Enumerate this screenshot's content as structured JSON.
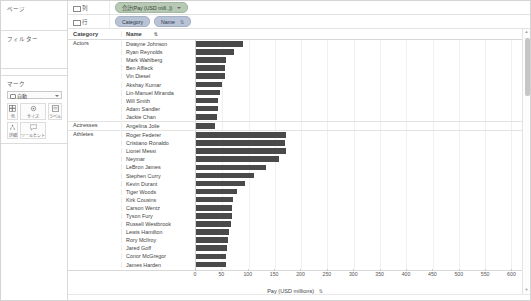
{
  "left_panel": {
    "pages_title": "ページ",
    "filters_title": "フィルター",
    "marks_title": "マーク",
    "marks_type": "自動",
    "marks_buttons": [
      {
        "label": "色",
        "icon": "color-icon"
      },
      {
        "label": "サイズ",
        "icon": "size-icon"
      },
      {
        "label": "ラベル",
        "icon": "label-icon"
      },
      {
        "label": "詳細",
        "icon": "detail-icon"
      },
      {
        "label": "ツールヒント",
        "icon": "tooltip-icon"
      }
    ]
  },
  "shelves": {
    "columns_label": "列",
    "rows_label": "行",
    "columns_pills": [
      {
        "text": "合計(Pay (USD mill..))",
        "color": "green",
        "caret": true
      }
    ],
    "rows_pills": [
      {
        "text": "Category",
        "color": "blue",
        "caret": false
      },
      {
        "text": "Name",
        "color": "blue",
        "caret": false,
        "sort": "⇅"
      }
    ]
  },
  "table": {
    "header_category": "Category",
    "header_name": "Name",
    "header_sort_icon": "⇅"
  },
  "chart_data": {
    "type": "bar",
    "title": "",
    "xlabel": "Pay (USD millions)",
    "ylabel": "",
    "xlim": [
      0,
      620
    ],
    "ticks": [
      0,
      50,
      100,
      150,
      200,
      250,
      300,
      350,
      400,
      450,
      500,
      550,
      600
    ],
    "grid": true,
    "orientation": "horizontal",
    "groups": [
      {
        "category": "Actors",
        "categories": [
          "Dwayne Johnson",
          "Ryan Reynolds",
          "Mark Wahlberg",
          "Ben Affleck",
          "Vin Diesel",
          "Akshay Kumar",
          "Lin-Manuel Miranda",
          "Will Smith",
          "Adam Sandler",
          "Jackie Chan"
        ],
        "values": [
          89.4,
          71.5,
          58,
          55,
          54.5,
          48.5,
          45.5,
          42,
          41,
          40.5
        ]
      },
      {
        "category": "Actresses",
        "categories": [
          "Angelina Jolie"
        ],
        "values": [
          35.5
        ]
      },
      {
        "category": "Athletes",
        "categories": [
          "Roger Federer",
          "Cristiano Ronaldo",
          "Lionel Messi",
          "Neymar",
          "LeBron James",
          "Stephen Curry",
          "Kevin Durant",
          "Tiger Woods",
          "Kirk Cousins",
          "Carson Wentz",
          "Tyson Fury",
          "Russell Westbrook",
          "Lewis Hamilton",
          "Rory McIlroy",
          "Jared Goff",
          "Conor McGregor",
          "James Harden"
        ],
        "values": [
          172,
          170,
          171,
          158,
          134,
          111,
          94,
          78,
          71,
          69,
          68,
          66,
          63,
          61,
          59,
          58,
          57
        ]
      }
    ]
  }
}
